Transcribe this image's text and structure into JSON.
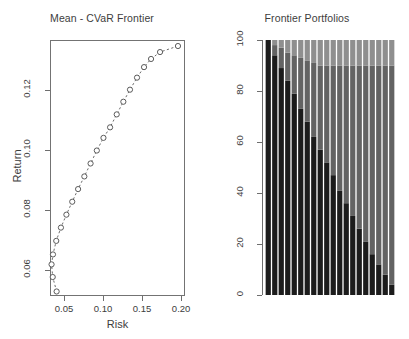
{
  "figure": {
    "background": "#ffffff",
    "panels": 2
  },
  "left_panel": {
    "title": "Mean - CVaR Frontier",
    "xlabel": "Risk",
    "ylabel": "Return"
  },
  "right_panel": {
    "title": "Frontier Portfolios"
  },
  "chart_data": [
    {
      "type": "scatter",
      "title": "Mean - CVaR Frontier",
      "xlabel": "Risk",
      "ylabel": "Return",
      "xlim": [
        0.032,
        0.205
      ],
      "ylim": [
        0.0515,
        0.1365
      ],
      "xticks": [
        0.05,
        0.1,
        0.15,
        0.2
      ],
      "xticklabels": [
        "0.05",
        "0.10",
        "0.15",
        "0.20"
      ],
      "yticks": [
        0.06,
        0.08,
        0.1,
        0.12
      ],
      "yticklabels": [
        "0.06",
        "0.08",
        "0.10",
        "0.12"
      ],
      "grid": false,
      "legend": null,
      "marker": "open-circle",
      "line_style": "dashed",
      "series": [
        {
          "name": "efficient frontier",
          "x": [
            0.0405,
            0.0355,
            0.034,
            0.0358,
            0.04,
            0.046,
            0.053,
            0.0605,
            0.068,
            0.076,
            0.084,
            0.092,
            0.1005,
            0.109,
            0.1175,
            0.126,
            0.1345,
            0.1435,
            0.1525,
            0.1615,
            0.173,
            0.196
          ],
          "y": [
            0.053,
            0.0578,
            0.062,
            0.0653,
            0.0698,
            0.0742,
            0.0785,
            0.0828,
            0.087,
            0.0912,
            0.0955,
            0.0998,
            0.104,
            0.1075,
            0.1118,
            0.116,
            0.12,
            0.124,
            0.1275,
            0.1302,
            0.1325,
            0.1345
          ]
        }
      ]
    },
    {
      "type": "bar",
      "subtype": "stacked-percent",
      "title": "Frontier Portfolios",
      "xlabel": "",
      "ylabel": "",
      "ylim": [
        0,
        100
      ],
      "yticks": [
        0,
        20,
        40,
        60,
        80,
        100
      ],
      "yticklabels": [
        "0",
        "20",
        "40",
        "60",
        "80",
        "100"
      ],
      "grid": false,
      "n_portfolios": 20,
      "categories": [
        "1",
        "2",
        "3",
        "4",
        "5",
        "6",
        "7",
        "8",
        "9",
        "10",
        "11",
        "12",
        "13",
        "14",
        "15",
        "16",
        "17",
        "18",
        "19",
        "20"
      ],
      "series": [
        {
          "name": "asset-1",
          "color": "#1c1c1c",
          "values": [
            100,
            94,
            89,
            84,
            79,
            73,
            68,
            62,
            57,
            52,
            47,
            41,
            36,
            31,
            26,
            21,
            16,
            12,
            8,
            4
          ]
        },
        {
          "name": "asset-2",
          "color": "#636363",
          "values": [
            0,
            4,
            8,
            11,
            15,
            20,
            24,
            29,
            33,
            38,
            43,
            49,
            54,
            59,
            64,
            69,
            74,
            78,
            82,
            86
          ]
        },
        {
          "name": "asset-3",
          "color": "#8f8f8f",
          "values": [
            0,
            2,
            3,
            5,
            6,
            7,
            8,
            9,
            10,
            10,
            10,
            10,
            10,
            10,
            10,
            10,
            10,
            10,
            10,
            10
          ]
        }
      ]
    }
  ]
}
